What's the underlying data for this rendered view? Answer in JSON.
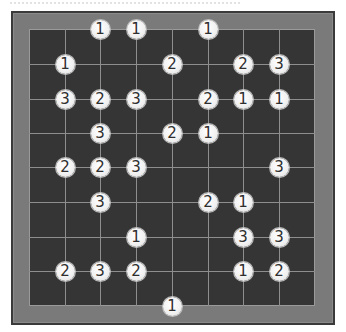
{
  "puzzle": {
    "type": "hashi-bridges",
    "grid_columns": 9,
    "grid_rows": 9,
    "column_x": [
      29,
      65,
      100,
      136,
      172,
      208,
      243,
      279,
      315
    ],
    "row_y": [
      29,
      64,
      99,
      133,
      167,
      202,
      237,
      271,
      306
    ],
    "colors": {
      "frame": "#7a7a7a",
      "frame_edge": "#3a3a3a",
      "board": "#353535",
      "gridline": "#8e8e8e",
      "island_fill": "#f1f1f1",
      "island_text": "#2e2e2e"
    },
    "islands": [
      {
        "row": 0,
        "col": 2,
        "value": "1"
      },
      {
        "row": 0,
        "col": 3,
        "value": "1"
      },
      {
        "row": 0,
        "col": 5,
        "value": "1"
      },
      {
        "row": 1,
        "col": 1,
        "value": "1"
      },
      {
        "row": 1,
        "col": 4,
        "value": "2"
      },
      {
        "row": 1,
        "col": 6,
        "value": "2"
      },
      {
        "row": 1,
        "col": 7,
        "value": "3"
      },
      {
        "row": 2,
        "col": 1,
        "value": "3"
      },
      {
        "row": 2,
        "col": 2,
        "value": "2"
      },
      {
        "row": 2,
        "col": 3,
        "value": "3"
      },
      {
        "row": 2,
        "col": 5,
        "value": "2"
      },
      {
        "row": 2,
        "col": 6,
        "value": "1"
      },
      {
        "row": 2,
        "col": 7,
        "value": "1"
      },
      {
        "row": 3,
        "col": 2,
        "value": "3"
      },
      {
        "row": 3,
        "col": 4,
        "value": "2"
      },
      {
        "row": 3,
        "col": 5,
        "value": "1"
      },
      {
        "row": 4,
        "col": 1,
        "value": "2"
      },
      {
        "row": 4,
        "col": 2,
        "value": "2"
      },
      {
        "row": 4,
        "col": 3,
        "value": "3"
      },
      {
        "row": 4,
        "col": 7,
        "value": "3"
      },
      {
        "row": 5,
        "col": 2,
        "value": "3"
      },
      {
        "row": 5,
        "col": 5,
        "value": "2"
      },
      {
        "row": 5,
        "col": 6,
        "value": "1"
      },
      {
        "row": 6,
        "col": 3,
        "value": "1"
      },
      {
        "row": 6,
        "col": 6,
        "value": "3"
      },
      {
        "row": 6,
        "col": 7,
        "value": "3"
      },
      {
        "row": 7,
        "col": 1,
        "value": "2"
      },
      {
        "row": 7,
        "col": 2,
        "value": "3"
      },
      {
        "row": 7,
        "col": 3,
        "value": "2"
      },
      {
        "row": 7,
        "col": 6,
        "value": "1"
      },
      {
        "row": 7,
        "col": 7,
        "value": "2"
      },
      {
        "row": 8,
        "col": 4,
        "value": "1"
      }
    ]
  }
}
